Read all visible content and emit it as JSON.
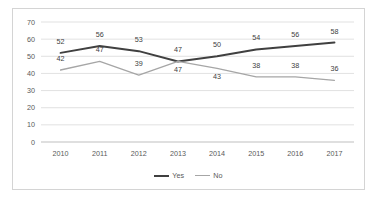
{
  "chart_data": {
    "type": "line",
    "title": "",
    "subtitle": "",
    "xlabel": "",
    "ylabel": "",
    "categories": [
      "2010",
      "2011",
      "2012",
      "2013",
      "2014",
      "2015",
      "2016",
      "2017"
    ],
    "series": [
      {
        "name": "Yes",
        "color": "#404040",
        "values": [
          52,
          56,
          53,
          47,
          50,
          54,
          56,
          58
        ],
        "label_offsets": [
          -9,
          -9,
          -9,
          -9,
          -9,
          -9,
          -9,
          -9
        ]
      },
      {
        "name": "No",
        "color": "#a6a6a6",
        "values": [
          42,
          47,
          39,
          47,
          43,
          38,
          38,
          36
        ],
        "label_offsets": [
          -9,
          -9,
          -9,
          11,
          11,
          -9,
          -9,
          -9
        ]
      }
    ],
    "ylim": [
      0,
      70
    ],
    "yticks": [
      0,
      10,
      20,
      30,
      40,
      50,
      60,
      70
    ],
    "ytick_labels": [
      "0",
      "10",
      "20",
      "30",
      "40",
      "50",
      "60",
      "70"
    ],
    "grid": true,
    "grid_color": "#d9d9d9",
    "axis_color": "#bfbfbf",
    "legend_position": "bottom-center",
    "data_labels": true,
    "tick_label_color": "#595959",
    "data_label_color": "#404040",
    "plot_background": "#ffffff"
  },
  "legend": {
    "entries": [
      {
        "label": "Yes",
        "color": "#404040"
      },
      {
        "label": "No",
        "color": "#a6a6a6"
      }
    ]
  },
  "frame": {
    "border_color": "#d4d4d4",
    "background": "#ffffff"
  }
}
